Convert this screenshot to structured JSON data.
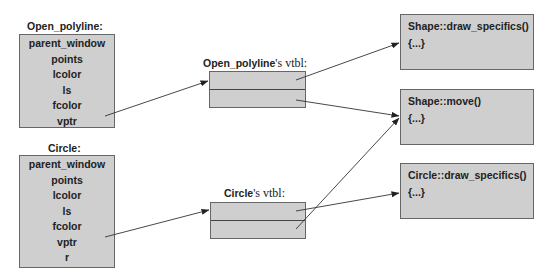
{
  "objects": [
    {
      "title": "Open_polyline:",
      "fields": [
        "parent_window",
        "points",
        "lcolor",
        "ls",
        "fcolor",
        "vptr"
      ]
    },
    {
      "title": "Circle:",
      "fields": [
        "parent_window",
        "points",
        "lcolor",
        "ls",
        "fcolor",
        "vptr",
        "r"
      ]
    }
  ],
  "vtables": [
    {
      "class_name": "Open_polyline",
      "suffix": "'s vtbl:"
    },
    {
      "class_name": "Circle",
      "suffix": "'s vtbl:"
    }
  ],
  "functions": [
    {
      "name": "Shape::draw_specifics()",
      "body": "{...}"
    },
    {
      "name": "Shape::move()",
      "body": "{...}"
    },
    {
      "name": "Circle::draw_specifics()",
      "body": "{...}"
    }
  ],
  "colors": {
    "box_fill": "#cfcfcf",
    "box_border": "#666666",
    "line": "#333333"
  }
}
